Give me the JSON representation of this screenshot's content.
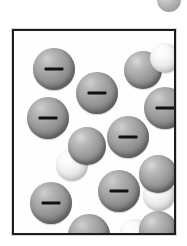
{
  "figure": {
    "title": "Aqueous solution of anions and water molecules",
    "caption": "",
    "background_color": "#ffffff"
  },
  "vessel": {
    "name": "solution-container",
    "border_color": "#1c1c1c",
    "fill_color": "#fefefe",
    "border_width_px": 2,
    "left_px": 12,
    "top_px": 29,
    "width_px": 164,
    "height_px": 206
  },
  "legend_colors": {
    "anion_sphere": "#9c9c9c",
    "dark_atom": "#8d8d8d",
    "light_atom": "#ededed",
    "charge_mark": "#111111"
  },
  "particles": {
    "anion_label": "−",
    "anion_count": 8,
    "molecule_count": 4,
    "anions": [
      {
        "name": "anion-1",
        "label": "−",
        "x": 19,
        "y": 17,
        "d": 42
      },
      {
        "name": "anion-2",
        "label": "−",
        "x": 62,
        "y": 41,
        "d": 42
      },
      {
        "name": "anion-3",
        "label": "−",
        "x": 13,
        "y": 66,
        "d": 42
      },
      {
        "name": "anion-4",
        "label": "−",
        "x": 130,
        "y": 56,
        "d": 42
      },
      {
        "name": "anion-5",
        "label": "−",
        "x": 93,
        "y": 85,
        "d": 42
      },
      {
        "name": "anion-6",
        "label": "−",
        "x": 84,
        "y": 139,
        "d": 42
      },
      {
        "name": "anion-7",
        "label": "−",
        "x": 16,
        "y": 151,
        "d": 42
      },
      {
        "name": "anion-8",
        "label": "−",
        "x": 54,
        "y": 183,
        "d": 42
      }
    ],
    "molecules": [
      {
        "name": "water-molecule-1",
        "x": 110,
        "y": 12,
        "dark_d": 38,
        "light_d": 30,
        "orientation": "horizontal-right"
      },
      {
        "name": "water-molecule-2",
        "x": 42,
        "y": 96,
        "dark_d": 38,
        "light_d": 32,
        "orientation": "diagonal-down-left"
      },
      {
        "name": "water-molecule-3",
        "x": 123,
        "y": 124,
        "dark_d": 38,
        "light_d": 32,
        "orientation": "vertical-down"
      },
      {
        "name": "water-molecule-4",
        "x": 105,
        "y": 180,
        "dark_d": 38,
        "light_d": 32,
        "orientation": "horizontal-left"
      }
    ],
    "edge_fragment": {
      "name": "cropped-sphere-fragment",
      "x": 157,
      "y": -12,
      "d": 24
    }
  }
}
